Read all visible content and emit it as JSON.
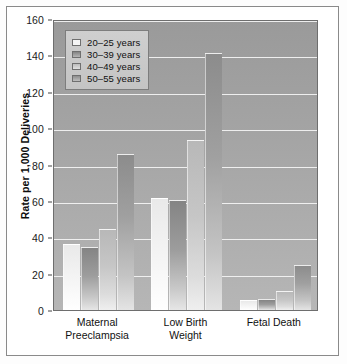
{
  "chart_data": {
    "type": "bar",
    "title": "",
    "subtitle": "",
    "xlabel": "",
    "ylabel": "Rate per 1,000 Deliveries",
    "categories": [
      "Maternal Preeclampsia",
      "Low Birth Weight",
      "Fetal Death"
    ],
    "category_lines": [
      [
        "Maternal",
        "Preeclampsia"
      ],
      [
        "Low Birth",
        "Weight"
      ],
      [
        "Fetal Death"
      ]
    ],
    "series": [
      {
        "name": "20–25 years",
        "values": [
          36,
          61,
          5
        ],
        "color": "#f4f4f4"
      },
      {
        "name": "30–39 years",
        "values": [
          34,
          60,
          5.5
        ],
        "color": "#9d9d9d"
      },
      {
        "name": "40–49 years",
        "values": [
          44,
          93,
          10
        ],
        "color": "#c6c6c6"
      },
      {
        "name": "50–55 years",
        "values": [
          85,
          141,
          24
        ],
        "color": "#a0a0a0"
      }
    ],
    "ylim": [
      0,
      160
    ],
    "yticks": [
      0,
      20,
      40,
      60,
      80,
      100,
      120,
      140,
      160
    ],
    "ytick_labels": [
      "0",
      "20",
      "40",
      "60",
      "80",
      "100",
      "120",
      "140",
      "160"
    ],
    "grid": true,
    "grid_color": "#f2f2f2",
    "legend_position": "top-left",
    "plot_background": "#a6a6a6",
    "frame_color": "#8a8a8a"
  }
}
